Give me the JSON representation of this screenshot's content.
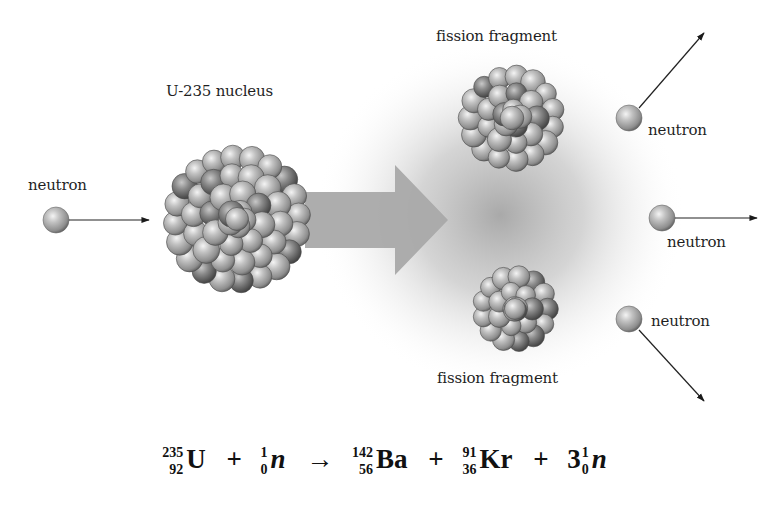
{
  "diagram": {
    "labels": {
      "incoming_neutron": "neutron",
      "nucleus": "U-235 nucleus",
      "fragment_top": "fission fragment",
      "fragment_bottom": "fission fragment",
      "neutron_out_1": "neutron",
      "neutron_out_2": "neutron",
      "neutron_out_3": "neutron"
    },
    "colors": {
      "sphere_light": "#e6e6e6",
      "sphere_mid": "#a8a8a8",
      "sphere_dark": "#555555",
      "big_arrow": "#a9a9a9",
      "glow": "#9a9a9a",
      "line": "#222222"
    }
  },
  "equation": {
    "reactant1": {
      "mass": "235",
      "atomic": "92",
      "symbol": "U"
    },
    "plus1": "+",
    "reactant2": {
      "mass": "1",
      "atomic": "0",
      "symbol": "n"
    },
    "arrow": "→",
    "product1": {
      "mass": "142",
      "atomic": "56",
      "symbol": "Ba"
    },
    "plus2": "+",
    "product2": {
      "mass": "91",
      "atomic": "36",
      "symbol": "Kr"
    },
    "plus3": "+",
    "product3": {
      "coefficient": "3",
      "mass": "1",
      "atomic": "0",
      "symbol": "n"
    }
  }
}
